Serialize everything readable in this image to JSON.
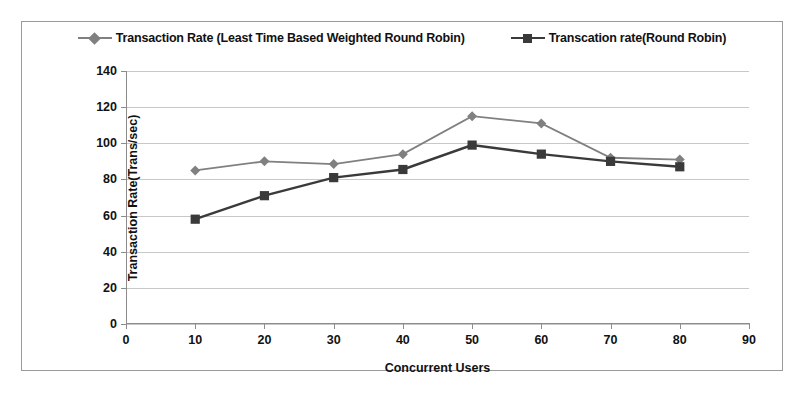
{
  "chart_data": {
    "type": "line",
    "title": "",
    "xlabel": "Concurrent Users",
    "ylabel": "Transaction Rate(Trans/sec)",
    "x": [
      10,
      20,
      30,
      40,
      50,
      60,
      70,
      80
    ],
    "xlim": [
      0,
      90
    ],
    "ylim": [
      0,
      140
    ],
    "xticks": [
      0,
      10,
      20,
      30,
      40,
      50,
      60,
      70,
      80,
      90
    ],
    "yticks": [
      0,
      20,
      40,
      60,
      80,
      100,
      120,
      140
    ],
    "grid": true,
    "legend_position": "top-center",
    "series": [
      {
        "name": "Transaction Rate (Least Time Based Weighted Round Robin)",
        "values": [
          85,
          90,
          88.5,
          94,
          115,
          111,
          92,
          91
        ],
        "color": "#808080",
        "marker": "diamond"
      },
      {
        "name": "Transcation rate(Round Robin)",
        "values": [
          58,
          71,
          81,
          85.5,
          99,
          94,
          90,
          87
        ],
        "color": "#3a3a3a",
        "marker": "square"
      }
    ]
  }
}
